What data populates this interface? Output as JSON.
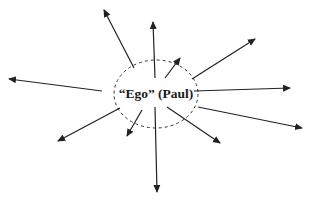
{
  "diagram": {
    "center_label": "“Ego” (Paul)",
    "colors": {
      "line": "#222222",
      "ellipse": "#333333",
      "text": "#1a1a1a",
      "background": "#ffffff"
    },
    "ego_ellipse": {
      "cx": 156,
      "cy": 94,
      "rx": 42,
      "ry": 34,
      "style": "dashed"
    },
    "arrows": [
      {
        "id": "upper-left",
        "x1": 134,
        "y1": 68,
        "x2": 104,
        "y2": 10
      },
      {
        "id": "up",
        "x1": 155,
        "y1": 78,
        "x2": 153,
        "y2": 22
      },
      {
        "id": "short-up-right",
        "x1": 165,
        "y1": 78,
        "x2": 180,
        "y2": 58
      },
      {
        "id": "upper-right",
        "x1": 192,
        "y1": 79,
        "x2": 255,
        "y2": 39
      },
      {
        "id": "right",
        "x1": 194,
        "y1": 91,
        "x2": 290,
        "y2": 88
      },
      {
        "id": "lower-right",
        "x1": 198,
        "y1": 107,
        "x2": 302,
        "y2": 128
      },
      {
        "id": "down-right",
        "x1": 167,
        "y1": 107,
        "x2": 220,
        "y2": 143
      },
      {
        "id": "down",
        "x1": 155,
        "y1": 107,
        "x2": 157,
        "y2": 192
      },
      {
        "id": "short-down-left",
        "x1": 142,
        "y1": 110,
        "x2": 127,
        "y2": 136
      },
      {
        "id": "lower-left",
        "x1": 120,
        "y1": 108,
        "x2": 58,
        "y2": 141
      },
      {
        "id": "left",
        "x1": 102,
        "y1": 91,
        "x2": 9,
        "y2": 79
      }
    ]
  }
}
